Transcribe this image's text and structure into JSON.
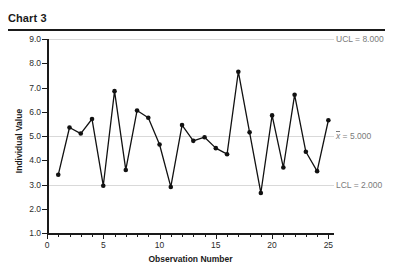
{
  "header": {
    "title": "Chart 3"
  },
  "chart_data": {
    "type": "line",
    "title": "Chart 3",
    "xlabel": "Observation Number",
    "ylabel": "Individual Value",
    "xlim": [
      0,
      25.5
    ],
    "ylim": [
      1.0,
      9.0
    ],
    "grid": true,
    "legend": "none",
    "x": [
      1,
      2,
      3,
      4,
      5,
      6,
      7,
      8,
      9,
      10,
      11,
      12,
      13,
      14,
      15,
      16,
      17,
      18,
      19,
      20,
      21,
      22,
      23,
      24,
      25
    ],
    "values": [
      3.4,
      5.35,
      5.1,
      5.7,
      2.95,
      6.85,
      3.6,
      6.05,
      5.75,
      4.65,
      2.9,
      5.45,
      4.8,
      4.95,
      4.5,
      4.25,
      7.65,
      5.15,
      2.65,
      5.85,
      3.7,
      6.7,
      4.35,
      3.55,
      5.65
    ],
    "series": [
      {
        "name": "Individual Value",
        "values": [
          3.4,
          5.35,
          5.1,
          5.7,
          2.95,
          6.85,
          3.6,
          6.05,
          5.75,
          4.65,
          2.9,
          5.45,
          4.8,
          4.95,
          4.5,
          4.25,
          7.65,
          5.15,
          2.65,
          5.85,
          3.7,
          6.7,
          4.35,
          3.55,
          5.65
        ]
      }
    ],
    "y_ticks": [
      "1.0",
      "2.0",
      "3.0",
      "4.0",
      "5.0",
      "6.0",
      "7.0",
      "8.0",
      "9.0"
    ],
    "y_tick_values": [
      1.0,
      2.0,
      3.0,
      4.0,
      5.0,
      6.0,
      7.0,
      8.0,
      9.0
    ],
    "x_ticks": [
      "0",
      "5",
      "10",
      "15",
      "20",
      "25"
    ],
    "x_tick_values": [
      0,
      5,
      10,
      15,
      20,
      25
    ],
    "control_limits": [
      {
        "name": "ucl",
        "label": "UCL = 8.000",
        "value": 8.0
      },
      {
        "name": "center-line",
        "label_prefix": "x",
        "label_suffix": " = 5.000",
        "value": 5.0
      },
      {
        "name": "lcl",
        "label": "LCL = 2.000",
        "value": 2.0
      }
    ],
    "colors": {
      "series": "#111111",
      "gridline": "#d9d9d9",
      "axis": "#1a1a1a",
      "limit_label": "#7a7a7a"
    }
  }
}
